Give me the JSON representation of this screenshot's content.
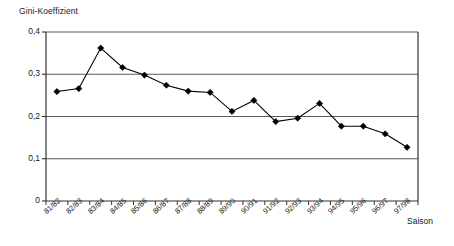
{
  "chart_data": {
    "type": "line",
    "title": "",
    "ylabel": "Gini-Koeffizient",
    "xlabel": "Saison",
    "categories": [
      "81/82",
      "82/83",
      "83/84",
      "84/85",
      "85/86",
      "86/87",
      "87/88",
      "88/89",
      "89/90",
      "90/91",
      "91/92",
      "92/93",
      "93/94",
      "94/95",
      "95/96",
      "96/97",
      "97/98"
    ],
    "values": [
      0.259,
      0.266,
      0.362,
      0.316,
      0.298,
      0.274,
      0.26,
      0.257,
      0.212,
      0.238,
      0.188,
      0.196,
      0.231,
      0.177,
      0.177,
      0.159,
      0.127
    ],
    "ylim": [
      0,
      0.4
    ],
    "yticks": [
      0,
      0.1,
      0.2,
      0.3,
      0.4
    ],
    "ytick_labels": [
      "0",
      "0,1",
      "0,2",
      "0,3",
      "0,4"
    ],
    "grid": "horizontal",
    "legend": "none",
    "series": [
      {
        "name": "Gini-Koeffizient",
        "marker": "diamond",
        "color": "#000000",
        "values": [
          0.259,
          0.266,
          0.362,
          0.316,
          0.298,
          0.274,
          0.26,
          0.257,
          0.212,
          0.238,
          0.188,
          0.196,
          0.231,
          0.177,
          0.177,
          0.159,
          0.127
        ]
      }
    ]
  },
  "colors": {
    "line": "#000000",
    "marker": "#000000",
    "grid": "#5a5a5a",
    "axis": "#333333",
    "background": "#ffffff",
    "text": "#1a1a1a"
  }
}
